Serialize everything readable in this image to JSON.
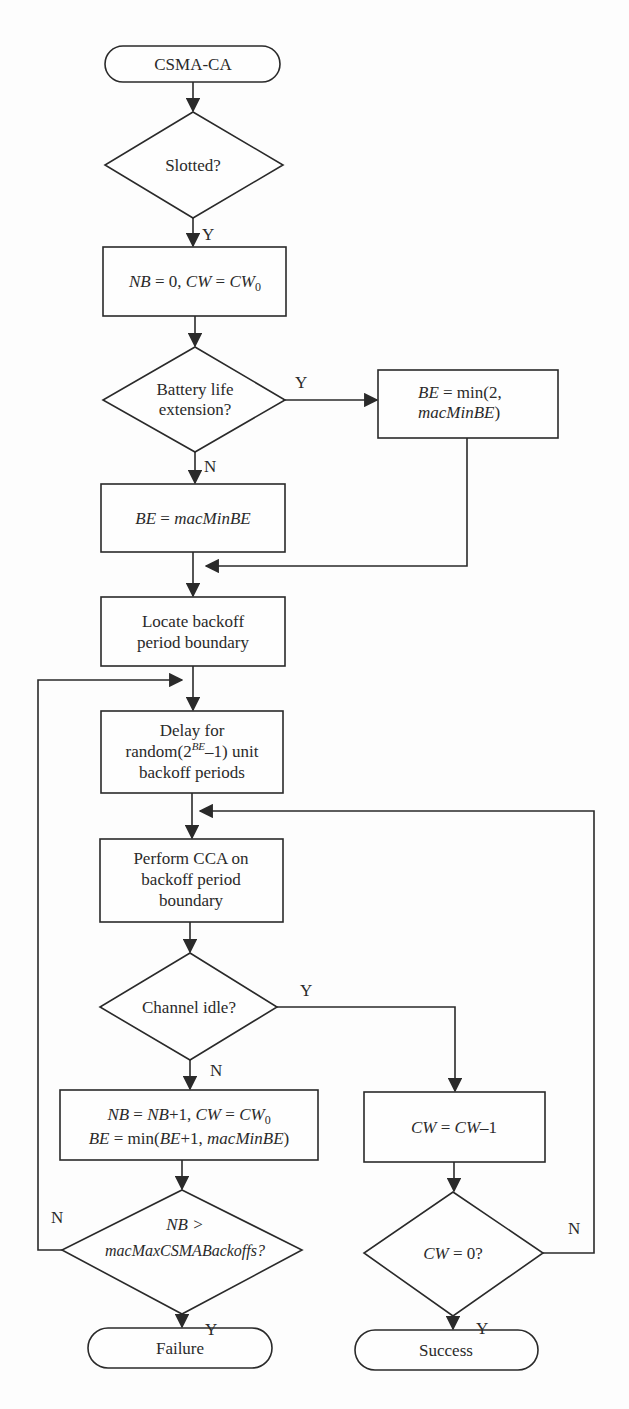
{
  "diagram": {
    "type": "flowchart",
    "nodes": {
      "start": {
        "kind": "terminal",
        "label": "CSMA-CA"
      },
      "slotted": {
        "kind": "decision",
        "label": "Slotted?"
      },
      "init": {
        "kind": "process",
        "label_a": "NB",
        "label_b": " = 0, ",
        "label_c": "CW",
        "label_d": " = ",
        "label_e": "CW",
        "label_sub": "0"
      },
      "battery": {
        "kind": "decision",
        "line1": "Battery life",
        "line2": "extension?"
      },
      "be_min2": {
        "kind": "process",
        "line1_a": "BE",
        "line1_b": " = min(2,",
        "line2_a": "macMinBE",
        "line2_b": ")"
      },
      "be_macmin": {
        "kind": "process",
        "label_a": "BE",
        "label_b": " = ",
        "label_c": "macMinBE"
      },
      "locate": {
        "kind": "process",
        "line1": "Locate backoff",
        "line2": "period boundary"
      },
      "delay": {
        "kind": "process",
        "line1": "Delay for",
        "line2_a": "random(2",
        "line2_sup": "BE",
        "line2_b": "–1) unit",
        "line3": "backoff periods"
      },
      "cca": {
        "kind": "process",
        "line1": "Perform CCA on",
        "line2": "backoff period",
        "line3": "boundary"
      },
      "idle": {
        "kind": "decision",
        "label": "Channel idle?"
      },
      "update": {
        "kind": "process",
        "line1_a": "NB",
        "line1_b": " = ",
        "line1_c": "NB",
        "line1_d": "+1, ",
        "line1_e": "CW",
        "line1_f": " = ",
        "line1_g": "CW",
        "line1_sub": "0",
        "line2_a": "BE",
        "line2_b": " = min(",
        "line2_c": "BE",
        "line2_d": "+1, ",
        "line2_e": "macMinBE",
        "line2_f": ")"
      },
      "nbmax": {
        "kind": "decision",
        "line1": "NB >",
        "line2": "macMaxCSMABackoffs?"
      },
      "cwdec": {
        "kind": "process",
        "label_a": "CW",
        "label_b": " = ",
        "label_c": "CW",
        "label_d": "–1"
      },
      "cwzero": {
        "kind": "decision",
        "label_a": "CW",
        "label_b": " = 0?"
      },
      "failure": {
        "kind": "terminal",
        "label": "Failure"
      },
      "success": {
        "kind": "terminal",
        "label": "Success"
      }
    },
    "edge_labels": {
      "slotted_yes": "Y",
      "battery_yes": "Y",
      "battery_no": "N",
      "idle_yes": "Y",
      "idle_no": "N",
      "nbmax_no": "N",
      "nbmax_yes": "Y",
      "cwzero_no": "N",
      "cwzero_yes": "Y"
    },
    "edges": [
      {
        "from": "start",
        "to": "slotted"
      },
      {
        "from": "slotted",
        "to": "init",
        "label": "Y"
      },
      {
        "from": "init",
        "to": "battery"
      },
      {
        "from": "battery",
        "to": "be_min2",
        "label": "Y"
      },
      {
        "from": "battery",
        "to": "be_macmin",
        "label": "N"
      },
      {
        "from": "be_min2",
        "to": "locate"
      },
      {
        "from": "be_macmin",
        "to": "locate"
      },
      {
        "from": "locate",
        "to": "delay"
      },
      {
        "from": "delay",
        "to": "cca"
      },
      {
        "from": "cca",
        "to": "idle"
      },
      {
        "from": "idle",
        "to": "cwdec",
        "label": "Y"
      },
      {
        "from": "idle",
        "to": "update",
        "label": "N"
      },
      {
        "from": "update",
        "to": "nbmax"
      },
      {
        "from": "nbmax",
        "to": "delay",
        "label": "N"
      },
      {
        "from": "nbmax",
        "to": "failure",
        "label": "Y"
      },
      {
        "from": "cwdec",
        "to": "cwzero"
      },
      {
        "from": "cwzero",
        "to": "cca",
        "label": "N"
      },
      {
        "from": "cwzero",
        "to": "success",
        "label": "Y"
      }
    ]
  }
}
